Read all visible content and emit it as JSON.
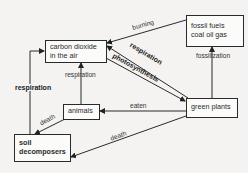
{
  "diagram": {
    "nodes": {
      "co2": {
        "line1": "carbon dioxide",
        "line2": "in the air"
      },
      "fossil": {
        "line1": "fossil fuels",
        "line2": "coal oil gas"
      },
      "animals": {
        "label": "animals"
      },
      "plants": {
        "label": "green plants"
      },
      "soil": {
        "line1": "soil",
        "line2": "decomposers"
      }
    },
    "edges": {
      "burning": "burning",
      "fossilization": "fossilization",
      "respiration_plants": "respiration",
      "photosynthesis": "photosynthesis",
      "respiration_animals": "respiration",
      "respiration_soil": "respiration",
      "eaten": "eaten",
      "death_animals": "death",
      "death_plants": "death"
    }
  }
}
